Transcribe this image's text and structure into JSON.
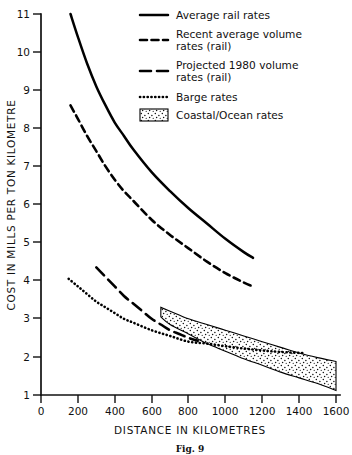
{
  "caption": "Fig. 9",
  "chart_data": {
    "type": "line",
    "title": "",
    "xlabel": "DISTANCE IN KILOMETRES",
    "ylabel": "COST IN MILLS PER TON KILOMETRE",
    "xlim": [
      0,
      1600
    ],
    "ylim": [
      1,
      11
    ],
    "xticks": [
      0,
      200,
      400,
      600,
      800,
      1000,
      1200,
      1400,
      1600
    ],
    "yticks": [
      1,
      2,
      3,
      4,
      5,
      6,
      7,
      8,
      9,
      10,
      11
    ],
    "grid": false,
    "legend_position": "top-right",
    "series": [
      {
        "name": "Average rail rates",
        "style": "solid",
        "x": [
          160,
          200,
          250,
          300,
          350,
          400,
          450,
          500,
          600,
          700,
          800,
          900,
          1000,
          1100,
          1150
        ],
        "y": [
          11.0,
          10.4,
          9.7,
          9.1,
          8.6,
          8.15,
          7.8,
          7.45,
          6.85,
          6.35,
          5.9,
          5.5,
          5.1,
          4.75,
          4.6
        ]
      },
      {
        "name": "Recent average volume rates (rail)",
        "style": "dashed",
        "x": [
          160,
          200,
          250,
          300,
          350,
          400,
          450,
          500,
          600,
          700,
          800,
          900,
          1000,
          1100,
          1150
        ],
        "y": [
          8.6,
          8.25,
          7.8,
          7.4,
          7.0,
          6.65,
          6.35,
          6.1,
          5.6,
          5.2,
          4.85,
          4.5,
          4.2,
          3.95,
          3.85
        ]
      },
      {
        "name": "Projected 1980 volume rates (rail)",
        "style": "long-dashed",
        "x": [
          300,
          350,
          400,
          450,
          500,
          550,
          600,
          650,
          700,
          750,
          800,
          850
        ],
        "y": [
          4.35,
          4.1,
          3.85,
          3.6,
          3.4,
          3.2,
          3.0,
          2.85,
          2.7,
          2.6,
          2.5,
          2.42
        ]
      },
      {
        "name": "Barge rates",
        "style": "dotted",
        "x": [
          150,
          200,
          250,
          300,
          350,
          400,
          450,
          500,
          600,
          700,
          800,
          900,
          1000,
          1100,
          1200,
          1300,
          1430
        ],
        "y": [
          4.05,
          3.85,
          3.65,
          3.45,
          3.3,
          3.15,
          3.0,
          2.9,
          2.7,
          2.55,
          2.4,
          2.35,
          2.28,
          2.22,
          2.17,
          2.13,
          2.1
        ]
      }
    ],
    "bands": [
      {
        "name": "Coastal/Ocean rates",
        "style": "stippled",
        "x": [
          650,
          700,
          800,
          900,
          1000,
          1100,
          1200,
          1300,
          1400,
          1500,
          1600
        ],
        "y_upper": [
          3.3,
          3.2,
          3.0,
          2.85,
          2.7,
          2.55,
          2.4,
          2.25,
          2.1,
          1.98,
          1.88
        ],
        "y_lower": [
          3.05,
          2.85,
          2.6,
          2.35,
          2.15,
          1.95,
          1.78,
          1.6,
          1.45,
          1.3,
          1.12
        ]
      }
    ],
    "legend": [
      {
        "label": "Average rail rates",
        "style": "solid"
      },
      {
        "label": "Recent average volume rates (rail)",
        "style": "dashed"
      },
      {
        "label": "Projected 1980 volume rates (rail)",
        "style": "long-dashed"
      },
      {
        "label": "Barge rates",
        "style": "dotted"
      },
      {
        "label": "Coastal/Ocean rates",
        "style": "stippled"
      }
    ]
  },
  "legend_lines": {
    "item1_line1": "Average rail rates",
    "item2_line1": "Recent average volume",
    "item2_line2": "rates (rail)",
    "item3_line1": "Projected 1980 volume",
    "item3_line2": "rates (rail)",
    "item4_line1": "Barge rates",
    "item5_line1": "Coastal/Ocean rates"
  },
  "axes": {
    "x_title": "DISTANCE IN KILOMETRES",
    "y_title": "COST IN MILLS PER TON KILOMETRE",
    "x_tick_0": "0",
    "x_tick_1": "200",
    "x_tick_2": "400",
    "x_tick_3": "600",
    "x_tick_4": "800",
    "x_tick_5": "1000",
    "x_tick_6": "1200",
    "x_tick_7": "1400",
    "x_tick_8": "1600",
    "y_tick_1": "1",
    "y_tick_2": "2",
    "y_tick_3": "3",
    "y_tick_4": "4",
    "y_tick_5": "5",
    "y_tick_6": "6",
    "y_tick_7": "7",
    "y_tick_8": "8",
    "y_tick_9": "9",
    "y_tick_10": "10",
    "y_tick_11": "11"
  },
  "colors": {
    "ink": "#000000",
    "background": "#ffffff"
  }
}
